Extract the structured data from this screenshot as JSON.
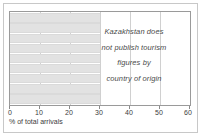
{
  "chart_data": {
    "type": "bar",
    "orientation": "horizontal",
    "title": "",
    "subtitle": "",
    "xlabel": "% of total arrivals",
    "ylabel": "",
    "xlim": [
      0,
      60
    ],
    "xticks": [
      0,
      10,
      20,
      30,
      40,
      50,
      60
    ],
    "xtick_labels": [
      "0",
      "10",
      "20",
      "30",
      "40",
      "50",
      "60"
    ],
    "grid": true,
    "grid_axis": "x",
    "legend": null,
    "categories": [
      "",
      "",
      "",
      "",
      "",
      "",
      "",
      "",
      ""
    ],
    "values": [
      30,
      30,
      30,
      30,
      30,
      30,
      30,
      30,
      30
    ],
    "bar_color": "#e2e2e2",
    "annotations": [
      {
        "lines": [
          "Kazakhstan does",
          "not publish tourism",
          "figures by",
          "country of origin"
        ],
        "style": "italic",
        "align": "center"
      }
    ]
  },
  "figure": {
    "axis_label": "% of total arrivals",
    "frame_color": "#c8c8c8",
    "plot_border_color": "#9a9a9a",
    "gridline_color": "#d0d0d0",
    "text_color": "#3c3c3c",
    "annotation_color": "#4a4a4a"
  },
  "annotation": {
    "line1": "Kazakhstan does",
    "line2": "not publish tourism",
    "line3": "figures by",
    "line4": "country of origin"
  },
  "ticks": {
    "t0": "0",
    "t1": "10",
    "t2": "20",
    "t3": "30",
    "t4": "40",
    "t5": "50",
    "t6": "60"
  }
}
